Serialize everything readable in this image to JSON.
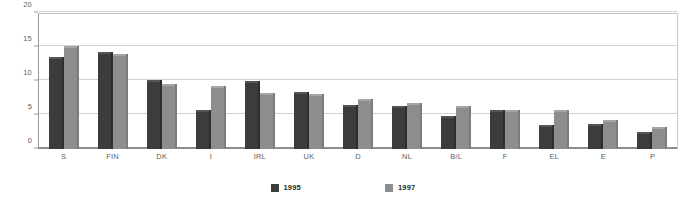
{
  "chart_data": {
    "type": "bar",
    "title": "",
    "subtitle": "",
    "xlabel": "",
    "ylabel": "",
    "ylim": [
      0,
      20
    ],
    "yticks": [
      0,
      5,
      10,
      15,
      20
    ],
    "ytick_labels": [
      "0",
      "5",
      "10",
      "15",
      "20"
    ],
    "grid": true,
    "legend_position": "bottom",
    "categories": [
      "S",
      "FIN",
      "DK",
      "I",
      "IRL",
      "UK",
      "D",
      "NL",
      "B/L",
      "F",
      "EL",
      "E",
      "P"
    ],
    "series": [
      {
        "name": "1995",
        "color": "#3c3c3c",
        "values": [
          13.6,
          14.3,
          10.2,
          5.8,
          10.0,
          8.4,
          6.4,
          6.3,
          4.8,
          5.7,
          3.5,
          3.7,
          2.5
        ]
      },
      {
        "name": "1997",
        "color": "#8d8d8d",
        "values": [
          15.2,
          14.0,
          9.5,
          9.2,
          8.3,
          8.1,
          7.3,
          6.7,
          6.3,
          5.8,
          5.8,
          4.2,
          3.3
        ]
      }
    ]
  },
  "legend": {
    "items": [
      {
        "label": "1995",
        "swatch": "s1"
      },
      {
        "label": "1997",
        "swatch": "s2"
      }
    ]
  }
}
